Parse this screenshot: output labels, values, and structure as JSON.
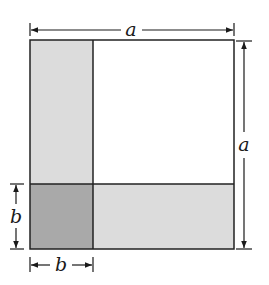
{
  "diagram": {
    "labels": {
      "top": "a",
      "right": "a",
      "left": "b",
      "bottom": "b"
    },
    "colors": {
      "background": "#ffffff",
      "large_square": "#ffffff",
      "strip": "#dcdcdc",
      "small_square": "#a9a9a9",
      "stroke": "#222222"
    }
  }
}
